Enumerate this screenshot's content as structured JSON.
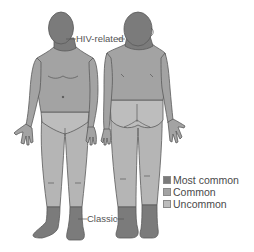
{
  "diagram": {
    "figures": [
      {
        "name": "front-view"
      },
      {
        "name": "back-view"
      }
    ],
    "annotations": {
      "hiv_related": "HIV-related",
      "classic": "Classic"
    },
    "legend": [
      {
        "label": "Most common",
        "color": "#7b7b7b"
      },
      {
        "label": "Common",
        "color": "#a3a3a3"
      },
      {
        "label": "Uncommon",
        "color": "#bdbdbd"
      }
    ],
    "colors": {
      "most_common": "#7b7b7b",
      "common": "#a3a3a3",
      "uncommon": "#bdbdbd",
      "outline": "#5a5a5a"
    }
  }
}
